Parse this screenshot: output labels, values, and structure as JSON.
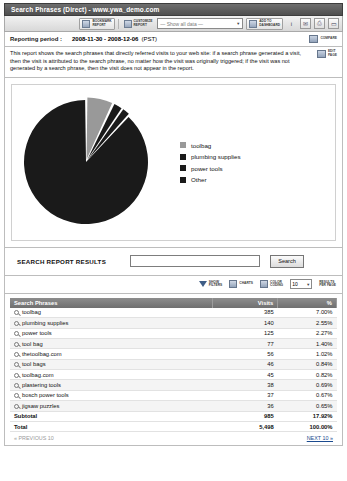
{
  "window": {
    "title": "Search Phrases (Direct) - www.ywa_demo.com"
  },
  "toolbar": {
    "bookmark_label": "BOOKMARK\nREPORT",
    "customize_label": "CUSTOMIZE\nREPORT",
    "data_select_value": "— Show all data —",
    "add_dashboard_label": "ADD TO\nDASHBOARD",
    "info_icon": "info-icon",
    "email_icon": "email-icon",
    "pdf_icon": "pdf-icon",
    "print_icon": "print-icon",
    "caret": "▼"
  },
  "period": {
    "label": "Reporting period :",
    "value": "2008-11-30 - 2008-12-06",
    "timezone": "(PST)",
    "compare_label": "COMPARE"
  },
  "description": {
    "text": "This report shows the search phrases that directly referred visits to your web site: if a search phrase generated a visit, then the visit is attributed to the search phrase, no matter how the visit was originally triggered; if the visit was not generated by a search phrase, then the visit does not appear in the report.",
    "edit_label": "EDIT\nPAGE"
  },
  "chart_data": {
    "type": "pie",
    "title": "",
    "labels": [
      "toolbag",
      "plumbing supplies",
      "power tools",
      "Other"
    ],
    "values": [
      7.0,
      2.55,
      2.27,
      88.18
    ],
    "colors": [
      "#999999",
      "#1a1a1a",
      "#1a1a1a",
      "#1a1a1a"
    ],
    "legend_position": "right",
    "units": "percent"
  },
  "search": {
    "label": "SEARCH REPORT RESULTS",
    "value": "",
    "placeholder": "",
    "button_label": "Search"
  },
  "filters": {
    "show_filters_label": "SHOW\nFILTERS",
    "charts_label": "CHARTS",
    "color_coding_label": "COLOR\nCODING",
    "per_page_value": "10",
    "per_page_label": "RESULTS\nPER PAGE",
    "caret": "▼"
  },
  "table": {
    "columns": [
      "Search Phrases",
      "Visits",
      "%"
    ],
    "rows": [
      {
        "phrase": "toolbag",
        "visits": "385",
        "percent": "7.00%"
      },
      {
        "phrase": "plumbing supplies",
        "visits": "140",
        "percent": "2.55%"
      },
      {
        "phrase": "power tools",
        "visits": "125",
        "percent": "2.27%"
      },
      {
        "phrase": "tool bag",
        "visits": "77",
        "percent": "1.40%"
      },
      {
        "phrase": "thetoolbag.com",
        "visits": "56",
        "percent": "1.02%"
      },
      {
        "phrase": "tool bags",
        "visits": "46",
        "percent": "0.84%"
      },
      {
        "phrase": "toolbag.com",
        "visits": "45",
        "percent": "0.82%"
      },
      {
        "phrase": "plastering tools",
        "visits": "38",
        "percent": "0.69%"
      },
      {
        "phrase": "bosch power tools",
        "visits": "37",
        "percent": "0.67%"
      },
      {
        "phrase": "jigsaw puzzles",
        "visits": "36",
        "percent": "0.65%"
      }
    ],
    "subtotal": {
      "label": "Subtotal",
      "visits": "985",
      "percent": "17.92%"
    },
    "total": {
      "label": "Total",
      "visits": "5,498",
      "percent": "100.00%"
    }
  },
  "pager": {
    "previous": "« PREVIOUS 10",
    "next": "NEXT 10 »"
  }
}
